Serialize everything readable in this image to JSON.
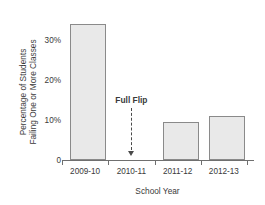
{
  "chart_data": {
    "type": "bar",
    "title": "",
    "xlabel": "School Year",
    "ylabel_line1": "Percentage of Students",
    "ylabel_line2": "Failing One or More Classes",
    "categories": [
      "2009-10",
      "2010-11",
      "2011-12",
      "2012-13"
    ],
    "values": [
      34,
      0,
      9.5,
      11
    ],
    "ylim": [
      0,
      38
    ],
    "yticks": [
      0,
      10,
      20,
      30
    ],
    "ytick_labels": [
      "0",
      "10%",
      "20%",
      "30%"
    ],
    "grid": false,
    "legend": "none",
    "annotations": [
      {
        "text": "Full Flip",
        "category": "2010-11",
        "style": "dashed-line-with-down-arrow"
      }
    ],
    "colors": {
      "bar_fill": "#e9e9e9",
      "bar_border": "#8a8a8a",
      "axis": "#6f6f6f",
      "text": "#3a3a3a",
      "annotation": "#4a4a4a"
    }
  }
}
